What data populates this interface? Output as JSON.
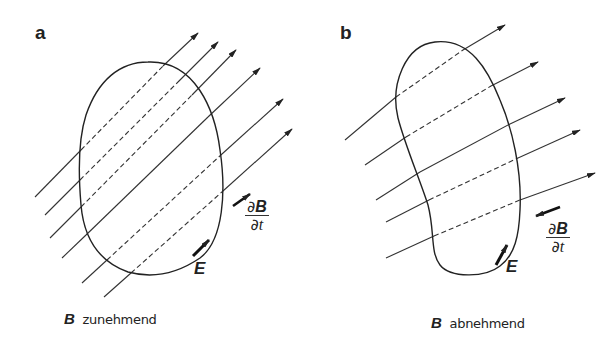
{
  "panels": [
    {
      "id": "a",
      "label": "a",
      "caption_symbol": "B",
      "caption_text": "zunehmend",
      "field_label": "E",
      "derivative": {
        "numerator_d": "∂",
        "numerator_sym": "B",
        "denominator_d": "∂",
        "denominator_sym": "t"
      },
      "derivative_direction": "up-right (same as B)"
    },
    {
      "id": "b",
      "label": "b",
      "caption_symbol": "B",
      "caption_text": "abnehmend",
      "field_label": "E",
      "derivative": {
        "numerator_d": "∂",
        "numerator_sym": "B",
        "denominator_d": "∂",
        "denominator_sym": "t"
      },
      "derivative_direction": "down-left (opposite to B)"
    }
  ],
  "colors": {
    "ink": "#222222",
    "background": "#ffffff"
  }
}
